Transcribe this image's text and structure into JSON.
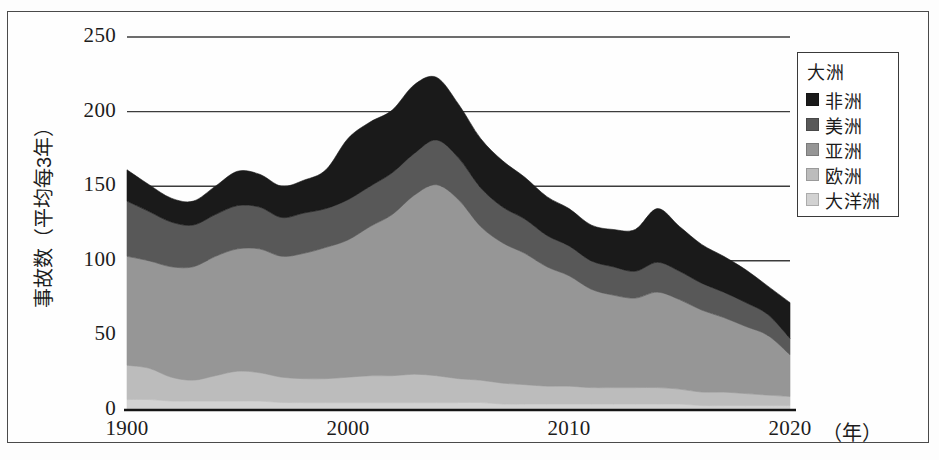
{
  "chart_data": {
    "type": "area",
    "stacked": true,
    "title": "",
    "subtitle": "",
    "xlabel": "（年）",
    "ylabel": "事故数（平均每3年）",
    "xlim": [
      1990,
      2020
    ],
    "ylim": [
      0,
      250
    ],
    "x_tick_labels": [
      "1900",
      "2000",
      "2010",
      "2020"
    ],
    "x_tick_values": [
      1990,
      2000,
      2010,
      2020
    ],
    "y_tick_labels": [
      "0",
      "50",
      "100",
      "150",
      "200",
      "250"
    ],
    "y_tick_values": [
      0,
      50,
      100,
      150,
      200,
      250
    ],
    "grid": "horizontal",
    "legend_position": "top-right",
    "legend_title": "大洲",
    "x": [
      1990,
      1991,
      1992,
      1993,
      1994,
      1995,
      1996,
      1997,
      1998,
      1999,
      2000,
      2001,
      2002,
      2003,
      2004,
      2005,
      2006,
      2007,
      2008,
      2009,
      2010,
      2011,
      2012,
      2013,
      2014,
      2015,
      2016,
      2017,
      2018,
      2019,
      2020
    ],
    "series": [
      {
        "name": "大洋洲",
        "color": "#d2d2d2",
        "values": [
          7,
          7,
          6,
          6,
          6,
          6,
          6,
          5,
          5,
          5,
          5,
          5,
          5,
          5,
          5,
          5,
          5,
          4,
          4,
          4,
          4,
          4,
          4,
          4,
          4,
          4,
          3,
          3,
          3,
          3,
          3
        ]
      },
      {
        "name": "欧洲",
        "color": "#bcbcbc",
        "values": [
          23,
          21,
          16,
          14,
          17,
          20,
          19,
          17,
          16,
          16,
          17,
          18,
          18,
          19,
          18,
          16,
          15,
          14,
          13,
          12,
          12,
          11,
          11,
          11,
          11,
          10,
          9,
          9,
          8,
          7,
          6
        ]
      },
      {
        "name": "亚洲",
        "color": "#969696",
        "values": [
          73,
          72,
          74,
          76,
          80,
          82,
          83,
          81,
          84,
          88,
          92,
          100,
          108,
          120,
          128,
          120,
          103,
          94,
          88,
          80,
          74,
          66,
          62,
          60,
          64,
          60,
          55,
          50,
          45,
          40,
          28
        ]
      },
      {
        "name": "美洲",
        "color": "#585858",
        "values": [
          37,
          33,
          30,
          28,
          28,
          29,
          28,
          26,
          27,
          26,
          27,
          27,
          28,
          28,
          30,
          28,
          26,
          24,
          23,
          21,
          20,
          19,
          19,
          18,
          20,
          19,
          18,
          17,
          16,
          14,
          11
        ]
      },
      {
        "name": "非洲",
        "color": "#1a1a1a",
        "values": [
          21,
          18,
          16,
          16,
          19,
          23,
          22,
          21,
          22,
          26,
          41,
          43,
          42,
          46,
          42,
          36,
          33,
          31,
          28,
          26,
          25,
          24,
          25,
          28,
          36,
          30,
          26,
          24,
          22,
          19,
          24
        ]
      }
    ],
    "totals": [
      161,
      151,
      142,
      140,
      150,
      160,
      158,
      150,
      154,
      161,
      182,
      193,
      201,
      218,
      223,
      205,
      182,
      167,
      156,
      143,
      135,
      124,
      121,
      121,
      135,
      123,
      111,
      103,
      94,
      83,
      72
    ],
    "annotations": []
  },
  "axes": {
    "y_label": "事故数（平均每3年）",
    "y_ticks": [
      "250",
      "200",
      "150",
      "100",
      "50",
      "0"
    ],
    "x_ticks": [
      "1900",
      "2000",
      "2010",
      "2020"
    ],
    "x_unit": "（年）"
  },
  "legend": {
    "title": "大洲",
    "items": [
      {
        "label": "非洲",
        "color": "#1a1a1a"
      },
      {
        "label": "美洲",
        "color": "#585858"
      },
      {
        "label": "亚洲",
        "color": "#969696"
      },
      {
        "label": "欧洲",
        "color": "#bcbcbc"
      },
      {
        "label": "大洋洲",
        "color": "#d2d2d2"
      }
    ]
  }
}
